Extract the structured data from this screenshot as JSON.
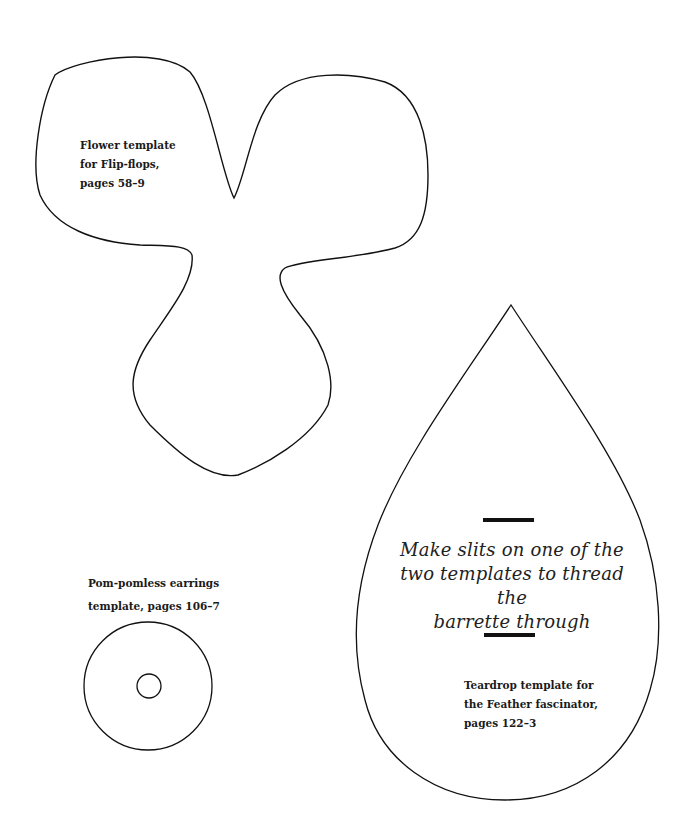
{
  "page": {
    "background": "#ffffff",
    "stroke_color": "#111111"
  },
  "templates": {
    "flower": {
      "label_lines": [
        "Flower template",
        "for Flip-flops,",
        "pages 58–9"
      ]
    },
    "earring": {
      "label_lines": [
        "Pom-pomless earrings",
        "template, pages 106–7"
      ]
    },
    "teardrop": {
      "instruction_lines": [
        "Make slits on one of the",
        "two templates to thread the",
        "barrette through"
      ],
      "label_lines": [
        "Teardrop template for",
        "the Feather fascinator,",
        "pages 122–3"
      ]
    }
  }
}
